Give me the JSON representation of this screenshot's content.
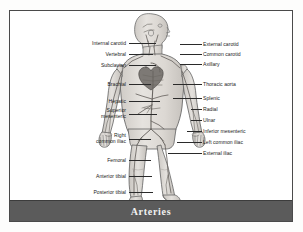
{
  "figure": {
    "caption": "Arteries",
    "frame_color": "#4a4a4a",
    "caption_bar_color": "#5b5b5b",
    "caption_text_color": "#f2f2f2",
    "body_fill": "#dedad5",
    "vessel_color": "#6e6a66"
  },
  "labels": {
    "left": [
      {
        "text": "Internal carotid",
        "x": 62,
        "y": 29,
        "width": 54,
        "leader_x": 119,
        "leader_y": 32,
        "leader_w": 27
      },
      {
        "text": "Vertebral",
        "x": 76,
        "y": 40,
        "width": 40,
        "leader_x": 119,
        "leader_y": 43,
        "leader_w": 24
      },
      {
        "text": "Subclavian",
        "x": 71,
        "y": 51,
        "width": 45,
        "leader_x": 119,
        "leader_y": 54,
        "leader_w": 27
      },
      {
        "text": "Brachial",
        "x": 79,
        "y": 70,
        "width": 37,
        "leader_x": 119,
        "leader_y": 73,
        "leader_w": 22
      },
      {
        "text": "Hepatic",
        "x": 80,
        "y": 87,
        "width": 36,
        "leader_x": 119,
        "leader_y": 90,
        "leader_w": 31
      },
      {
        "text": "Superior\nmesenteric",
        "x": 69,
        "y": 96,
        "width": 47,
        "leader_x": 119,
        "leader_y": 103,
        "leader_w": 28
      },
      {
        "text": "Right\ncommon iliac",
        "x": 62,
        "y": 121,
        "width": 54,
        "leader_x": 119,
        "leader_y": 128,
        "leader_w": 22
      },
      {
        "text": "Femoral",
        "x": 79,
        "y": 146,
        "width": 37,
        "leader_x": 119,
        "leader_y": 149,
        "leader_w": 22
      },
      {
        "text": "Anterior tibial",
        "x": 66,
        "y": 162,
        "width": 50,
        "leader_x": 119,
        "leader_y": 165,
        "leader_w": 23
      },
      {
        "text": "Posterior tibial",
        "x": 64,
        "y": 178,
        "width": 52,
        "leader_x": 119,
        "leader_y": 181,
        "leader_w": 24
      }
    ],
    "right": [
      {
        "text": "External carotid",
        "x": 193,
        "y": 30,
        "leader_x": 170,
        "leader_y": 33,
        "leader_w": 22
      },
      {
        "text": "Common carotid",
        "x": 193,
        "y": 40,
        "leader_x": 170,
        "leader_y": 43,
        "leader_w": 22
      },
      {
        "text": "Axillary",
        "x": 193,
        "y": 50,
        "leader_x": 170,
        "leader_y": 53,
        "leader_w": 22
      },
      {
        "text": "Thoracic aorta",
        "x": 193,
        "y": 70,
        "leader_x": 163,
        "leader_y": 73,
        "leader_w": 29
      },
      {
        "text": "Splenic",
        "x": 193,
        "y": 84,
        "leader_x": 163,
        "leader_y": 87,
        "leader_w": 29
      },
      {
        "text": "Radial",
        "x": 193,
        "y": 95,
        "leader_x": 181,
        "leader_y": 98,
        "leader_w": 11
      },
      {
        "text": "Ulnar",
        "x": 193,
        "y": 106,
        "leader_x": 181,
        "leader_y": 109,
        "leader_w": 11
      },
      {
        "text": "Inferior mesenteric",
        "x": 193,
        "y": 117,
        "leader_x": 177,
        "leader_y": 120,
        "leader_w": 15
      },
      {
        "text": "Left common iliac",
        "x": 193,
        "y": 128,
        "leader_x": 167,
        "leader_y": 131,
        "leader_w": 25
      },
      {
        "text": "External iliac",
        "x": 193,
        "y": 139,
        "leader_x": 158,
        "leader_y": 142,
        "leader_w": 34
      }
    ]
  }
}
